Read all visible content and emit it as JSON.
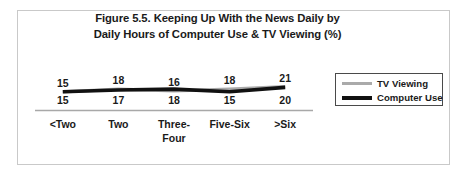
{
  "figure": {
    "title_line1": "Figure 5.5. Keeping Up With the News Daily by",
    "title_line2": "Daily Hours of Computer Use & TV Viewing (%)"
  },
  "legend": {
    "tv_label": "TV Viewing",
    "computer_label": "Computer Use"
  },
  "chart_data": {
    "type": "line",
    "title": "Figure 5.5. Keeping Up With the News Daily by Daily Hours of Computer Use & TV Viewing (%)",
    "xlabel": "",
    "ylabel": "",
    "ylim": [
      0,
      25
    ],
    "grid": false,
    "legend_position": "right",
    "categories": [
      "<Two",
      "Two",
      "Three-Four",
      "Five-Six",
      ">Six"
    ],
    "category_display": [
      [
        "<Two"
      ],
      [
        "Two"
      ],
      [
        "Three-",
        "Four"
      ],
      [
        "Five-Six"
      ],
      [
        ">Six"
      ]
    ],
    "series": [
      {
        "name": "TV Viewing",
        "color": "#aaaaaa",
        "values": [
          15,
          18,
          16,
          18,
          21
        ],
        "label_positions": "above"
      },
      {
        "name": "Computer Use",
        "color": "#111111",
        "values": [
          15,
          17,
          18,
          15,
          20
        ],
        "label_positions": "below"
      }
    ]
  }
}
